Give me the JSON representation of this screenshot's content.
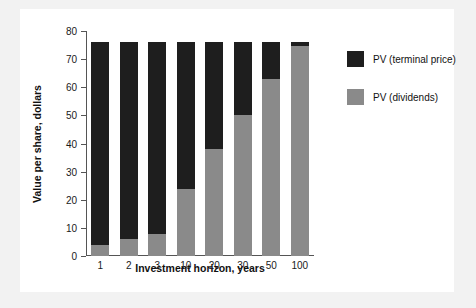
{
  "chart_data": {
    "type": "bar",
    "subtype": "stacked",
    "title": "",
    "xlabel": "Investment horizon, years",
    "ylabel": "Value per share, dollars",
    "categories": [
      "1",
      "2",
      "3",
      "10",
      "20",
      "30",
      "50",
      "100"
    ],
    "ylim": [
      0,
      80
    ],
    "yticks": [
      0,
      10,
      20,
      30,
      40,
      50,
      60,
      70,
      80
    ],
    "ytick_labels": [
      "0",
      "10",
      "20",
      "30",
      "40",
      "50",
      "60",
      "70",
      "80"
    ],
    "grid": false,
    "legend_position": "right",
    "series": [
      {
        "name": "PV (dividends)",
        "color": "#8a8a8a",
        "values": [
          4,
          6,
          8,
          24,
          38,
          50,
          63,
          74.5
        ]
      },
      {
        "name": "PV (terminal price)",
        "color": "#1e1e1e",
        "values": [
          72,
          70,
          68,
          52,
          38,
          26,
          13,
          1.5
        ]
      }
    ],
    "totals": [
      76,
      76,
      76,
      76,
      76,
      76,
      76,
      76
    ],
    "stack_order": [
      "PV (dividends)",
      "PV (terminal price)"
    ]
  },
  "legend": {
    "entries": [
      {
        "label": "PV (terminal price)",
        "color": "#1e1e1e"
      },
      {
        "label": "PV (dividends)",
        "color": "#8a8a8a"
      }
    ]
  },
  "colors": {
    "figure_background": "#ffffff",
    "page_background": "#f2f2f2",
    "axis": "#555555",
    "text": "#111111"
  }
}
